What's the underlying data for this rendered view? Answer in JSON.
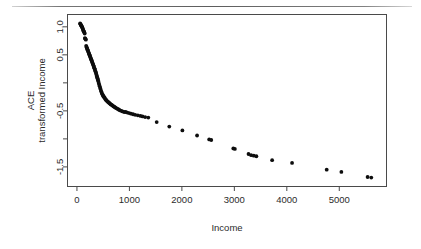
{
  "figure": {
    "background_color": "#ffffff",
    "ink_color": "#0d0d0d",
    "axis_color": "#4a4a4a"
  },
  "page_rule": {
    "name": "page-separator-rule",
    "visible": true
  },
  "axes": {
    "x_title": "Income",
    "y_title_line1": "ACE",
    "y_title_line2": "transformed Income",
    "x_ticks": [
      "0",
      "1000",
      "2000",
      "3000",
      "4000",
      "5000"
    ],
    "x_tick_values": [
      0,
      1000,
      2000,
      3000,
      4000,
      5000
    ],
    "y_ticks": [
      "1.0",
      "0.5",
      "",
      "-0.5",
      "",
      "-1.5"
    ],
    "y_tick_values": [
      1.0,
      0.5,
      0.0,
      -0.5,
      -1.0,
      -1.5
    ]
  },
  "chart_data": {
    "type": "scatter",
    "title": "",
    "subtitle": "",
    "xlabel": "Income",
    "ylabel": "ACE transformed Income",
    "xlim": [
      -180,
      5900
    ],
    "ylim": [
      -1.85,
      1.22
    ],
    "grid": false,
    "legend": null,
    "marker": "filled-circle",
    "marker_size_px": 1.9,
    "annotations": [],
    "series": [
      {
        "name": "ACE transformed Income",
        "x": [
          60,
          66,
          72,
          78,
          84,
          90,
          96,
          101,
          106,
          112,
          118,
          124,
          130,
          136,
          142,
          148,
          152,
          158,
          164,
          170,
          176,
          182,
          188,
          194,
          200,
          206,
          212,
          218,
          224,
          230,
          236,
          242,
          248,
          254,
          260,
          266,
          272,
          278,
          284,
          290,
          296,
          302,
          308,
          314,
          320,
          326,
          332,
          338,
          344,
          350,
          356,
          362,
          368,
          374,
          380,
          386,
          392,
          398,
          404,
          410,
          418,
          426,
          434,
          442,
          450,
          458,
          466,
          474,
          482,
          490,
          498,
          506,
          514,
          522,
          530,
          540,
          550,
          560,
          570,
          580,
          592,
          604,
          616,
          628,
          640,
          655,
          670,
          685,
          700,
          715,
          730,
          748,
          766,
          784,
          802,
          820,
          845,
          870,
          900,
          930,
          960,
          995,
          1030,
          1070,
          1110,
          1160,
          1210,
          1250,
          1300,
          1360,
          1520,
          1760,
          2010,
          2290,
          2520,
          2560,
          2980,
          3010,
          3270,
          3320,
          3370,
          3420,
          3720,
          4100,
          4760,
          5040,
          5540,
          5610
        ],
        "y": [
          1.06,
          1.05,
          1.04,
          1.03,
          1.02,
          1.01,
          1.0,
          0.99,
          0.98,
          0.96,
          0.95,
          0.93,
          0.92,
          0.91,
          0.9,
          0.88,
          0.8,
          0.79,
          0.78,
          0.77,
          0.66,
          0.64,
          0.63,
          0.61,
          0.6,
          0.58,
          0.57,
          0.55,
          0.54,
          0.52,
          0.51,
          0.49,
          0.48,
          0.46,
          0.45,
          0.43,
          0.42,
          0.4,
          0.39,
          0.37,
          0.36,
          0.34,
          0.33,
          0.31,
          0.3,
          0.28,
          0.26,
          0.25,
          0.23,
          0.21,
          0.2,
          0.18,
          0.16,
          0.14,
          0.12,
          0.1,
          0.08,
          0.06,
          0.04,
          0.02,
          -0.01,
          -0.04,
          -0.06,
          -0.09,
          -0.11,
          -0.14,
          -0.16,
          -0.18,
          -0.2,
          -0.21,
          -0.23,
          -0.24,
          -0.25,
          -0.26,
          -0.27,
          -0.29,
          -0.3,
          -0.31,
          -0.32,
          -0.33,
          -0.34,
          -0.35,
          -0.36,
          -0.37,
          -0.38,
          -0.39,
          -0.4,
          -0.41,
          -0.42,
          -0.43,
          -0.44,
          -0.45,
          -0.46,
          -0.47,
          -0.48,
          -0.49,
          -0.5,
          -0.51,
          -0.52,
          -0.52,
          -0.53,
          -0.54,
          -0.55,
          -0.56,
          -0.57,
          -0.58,
          -0.59,
          -0.6,
          -0.61,
          -0.62,
          -0.7,
          -0.78,
          -0.85,
          -0.94,
          -1.01,
          -1.02,
          -1.17,
          -1.18,
          -1.27,
          -1.29,
          -1.3,
          -1.31,
          -1.38,
          -1.43,
          -1.55,
          -1.59,
          -1.68,
          -1.69
        ]
      }
    ]
  }
}
